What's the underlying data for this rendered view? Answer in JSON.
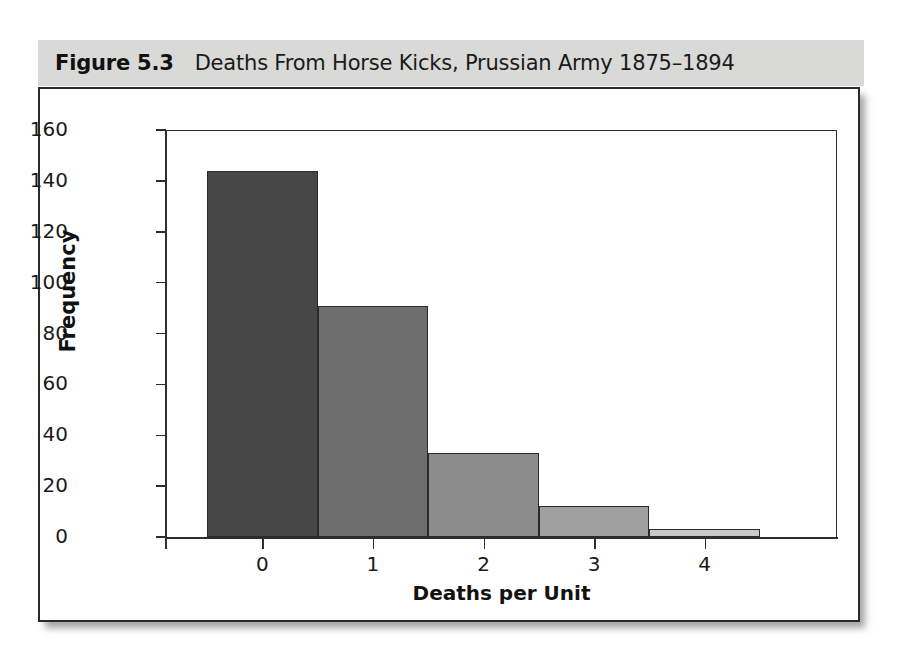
{
  "figure": {
    "number": "Figure 5.3",
    "caption": "Deaths From Horse Kicks, Prussian Army 1875–1894"
  },
  "chart_data": {
    "type": "bar",
    "title": "Deaths From Horse Kicks, Prussian Army 1875–1894",
    "categories": [
      "0",
      "1",
      "2",
      "3",
      "4"
    ],
    "values": [
      144,
      91,
      33,
      12,
      3
    ],
    "xlabel": "Deaths per Unit",
    "ylabel": "Frequency",
    "ylim": [
      0,
      160
    ],
    "ytick_labels": [
      "0",
      "20",
      "40",
      "60",
      "80",
      "100",
      "120",
      "140",
      "160"
    ],
    "ytick_values": [
      0,
      20,
      40,
      60,
      80,
      100,
      120,
      140,
      160
    ],
    "xtick_labels": [
      "0",
      "1",
      "2",
      "3",
      "4"
    ],
    "grid": false,
    "legend": "none",
    "bar_colors": [
      "#474747",
      "#6e6e6e",
      "#8c8c8c",
      "#a0a0a0",
      "#c9c9c9"
    ],
    "bar_edge_color": "#2b2b2b",
    "axis_color": "#2e2e2e",
    "caption_band_color": "#d9d9d7"
  }
}
